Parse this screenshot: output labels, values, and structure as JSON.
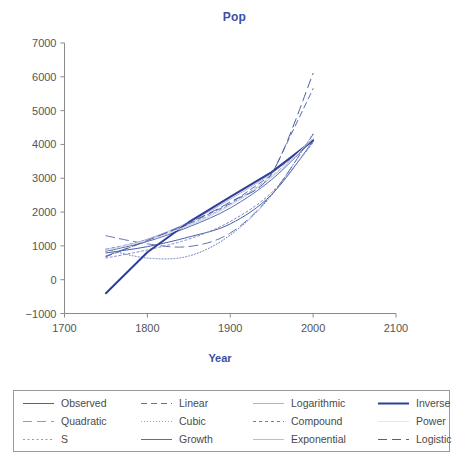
{
  "chart_data": {
    "type": "line",
    "title": "Pop",
    "xlabel": "Year",
    "ylabel": "",
    "xlim": [
      1700,
      2100
    ],
    "ylim": [
      -1000,
      7000
    ],
    "xticks": [
      1700,
      1800,
      1900,
      2000,
      2100
    ],
    "yticks": [
      -1000,
      0,
      1000,
      2000,
      3000,
      4000,
      5000,
      6000,
      7000
    ],
    "grid": false,
    "legend_position": "bottom",
    "x": [
      1750,
      1800,
      1850,
      1900,
      1950,
      2000
    ],
    "series": [
      {
        "name": "Observed",
        "style": "solid",
        "color": "#4a5fa8",
        "width": 1,
        "values": [
          791,
          978,
          1262,
          1650,
          2519,
          4100
        ]
      },
      {
        "name": "Quadratic",
        "style": "long-dash",
        "color": "#6575b5",
        "width": 1,
        "values": [
          1300,
          1060,
          980,
          1380,
          2520,
          4300
        ]
      },
      {
        "name": "S",
        "style": "dotted",
        "color": "#7b8ac2",
        "width": 1,
        "values": [
          640,
          880,
          1200,
          1720,
          2580,
          4050
        ]
      },
      {
        "name": "Linear",
        "style": "dashed",
        "color": "#5c6db0",
        "width": 1,
        "values": [
          680,
          1150,
          1650,
          2250,
          3100,
          5650
        ]
      },
      {
        "name": "Cubic",
        "style": "fine-dotted",
        "color": "#6a7abc",
        "width": 1,
        "values": [
          900,
          640,
          700,
          1320,
          2500,
          4320
        ]
      },
      {
        "name": "Growth",
        "style": "solid",
        "color": "#5a6cb0",
        "width": 1,
        "values": [
          840,
          1130,
          1560,
          2120,
          2960,
          4150
        ]
      },
      {
        "name": "Logarithmic",
        "style": "solid-light",
        "color": "#a8b2d4",
        "width": 1,
        "values": [
          860,
          1200,
          1700,
          2380,
          3150,
          4120
        ]
      },
      {
        "name": "Compound",
        "style": "dashed-fine",
        "color": "#6a7abc",
        "width": 1,
        "values": [
          900,
          1180,
          1620,
          2230,
          3060,
          4180
        ]
      },
      {
        "name": "Exponential",
        "style": "solid-light",
        "color": "#b5bedb",
        "width": 1,
        "values": [
          880,
          1160,
          1600,
          2200,
          3030,
          4160
        ]
      },
      {
        "name": "Inverse",
        "style": "solid-thick",
        "color": "#2f3f96",
        "width": 2,
        "values": [
          -400,
          810,
          1700,
          2450,
          3180,
          4120
        ]
      },
      {
        "name": "Power",
        "style": "solid-faint",
        "color": "#dfe3ef",
        "width": 1,
        "values": [
          870,
          1170,
          1610,
          2210,
          3050,
          4170
        ]
      },
      {
        "name": "Logistic",
        "style": "long-dash",
        "color": "#4a5fa8",
        "width": 1,
        "values": [
          700,
          1160,
          1680,
          2300,
          3140,
          6100
        ]
      }
    ]
  },
  "title": {
    "text": "Pop"
  },
  "axes": {
    "x": {
      "label": "Year",
      "ticks": [
        "1700",
        "1800",
        "1900",
        "2000",
        "2100"
      ]
    },
    "y": {
      "label": "",
      "ticks": [
        "7000",
        "6000",
        "5000",
        "4000",
        "3000",
        "2000",
        "1000",
        "0",
        "-1000"
      ]
    }
  },
  "legend": {
    "items": [
      {
        "label": "Observed",
        "style": "solid",
        "color": "#4a5fa8"
      },
      {
        "label": "Linear",
        "style": "dashed",
        "color": "#5c6db0"
      },
      {
        "label": "Logarithmic",
        "style": "solid-light",
        "color": "#a8b2d4"
      },
      {
        "label": "Inverse",
        "style": "solid-thick",
        "color": "#2f3f96"
      },
      {
        "label": "Quadratic",
        "style": "long-dash",
        "color": "#8c99c9"
      },
      {
        "label": "Cubic",
        "style": "fine-dotted",
        "color": "#9aa6d0"
      },
      {
        "label": "Compound",
        "style": "dashed-fine",
        "color": "#6a7abc"
      },
      {
        "label": "Power",
        "style": "solid-faint",
        "color": "#e2e6f1"
      },
      {
        "label": "S",
        "style": "dotted",
        "color": "#8c99c9"
      },
      {
        "label": "Growth",
        "style": "solid",
        "color": "#5a6cb0"
      },
      {
        "label": "Exponential",
        "style": "solid-light",
        "color": "#b5bedb"
      },
      {
        "label": "Logistic",
        "style": "long-dash",
        "color": "#4a5fa8"
      }
    ]
  },
  "colors": {
    "title": "#3a4fa0",
    "axis": "#8a8a8a",
    "tick_text": "#555555",
    "legend_border": "#9a9a9a",
    "accent": "#2f3f96"
  }
}
